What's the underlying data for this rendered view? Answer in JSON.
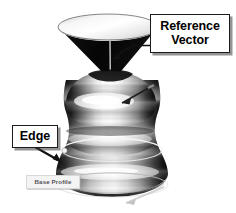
{
  "figure": {
    "background_color": "#ffffff",
    "geometry": {
      "cone": {
        "name": "inverted-cone-funnel",
        "interior_color": "#ffffff",
        "exterior_color": "#0b0b0b",
        "top_ellipse_center_x": 108,
        "top_ellipse_center_y": 27,
        "top_ellipse_rx": 50,
        "top_ellipse_ry": 13,
        "apex_x": 110,
        "apex_y": 80
      },
      "body": {
        "name": "bulbous-vase-body",
        "highlight_color": "#fdfdfd",
        "shadow_color": "#141414",
        "upper_bulb_center_y": 112,
        "upper_bulb_rx": 45,
        "waist_y": 148,
        "waist_rx": 37
      },
      "base": {
        "name": "flared-base",
        "widest_rx": 56,
        "widest_y": 174,
        "bottom_rim_center_y": 188,
        "bottom_rim_rx": 54,
        "bottom_rim_ry": 11
      }
    },
    "vectors": [
      {
        "name": "reference-vector-line",
        "description": "thin vertical axis line inside cone",
        "color": "#9a9a9a",
        "x": 110,
        "y_top": 42,
        "y_bottom": 92
      },
      {
        "name": "surface-normal-vector",
        "description": "diagonal arrow on upper body surface",
        "color": "#2a2a2a",
        "x1": 153,
        "y1": 86,
        "x2": 122,
        "y2": 103
      },
      {
        "name": "tangent-vector-bottom",
        "description": "faint arrow along bottom rim",
        "color": "#b4b4b4",
        "x1": 160,
        "y1": 188,
        "x2": 122,
        "y2": 204
      }
    ],
    "curves": [
      {
        "name": "edge-profile-ellipse",
        "description": "highlighted edge curve at the waist",
        "color": "#f2f2f2",
        "center_x": 112,
        "center_y": 150,
        "rx": 52,
        "ry": 11
      },
      {
        "name": "edge-node-marker",
        "color": "#efefef",
        "x": 66,
        "y": 151,
        "radius": 2.6
      }
    ]
  },
  "callouts": {
    "reference_vector": {
      "label_line_1": "Reference",
      "label_line_2": "Vector",
      "border_color": "#1b1b1b",
      "arrow": {
        "name": "reference-vector-arrow",
        "color": "#111111",
        "from_x": 156,
        "from_y": 46,
        "to_x": 113,
        "to_y": 58
      }
    },
    "edge": {
      "label": "Edge",
      "border_color": "#1b1b1b",
      "arrow": {
        "name": "edge-arrow",
        "color": "#111111",
        "from_x": 36,
        "from_y": 147,
        "to_x": 62,
        "to_y": 162
      }
    },
    "base_profile": {
      "label": "Base Profile",
      "border_color": "#d8d8d8",
      "text_color": "#55555a"
    }
  }
}
